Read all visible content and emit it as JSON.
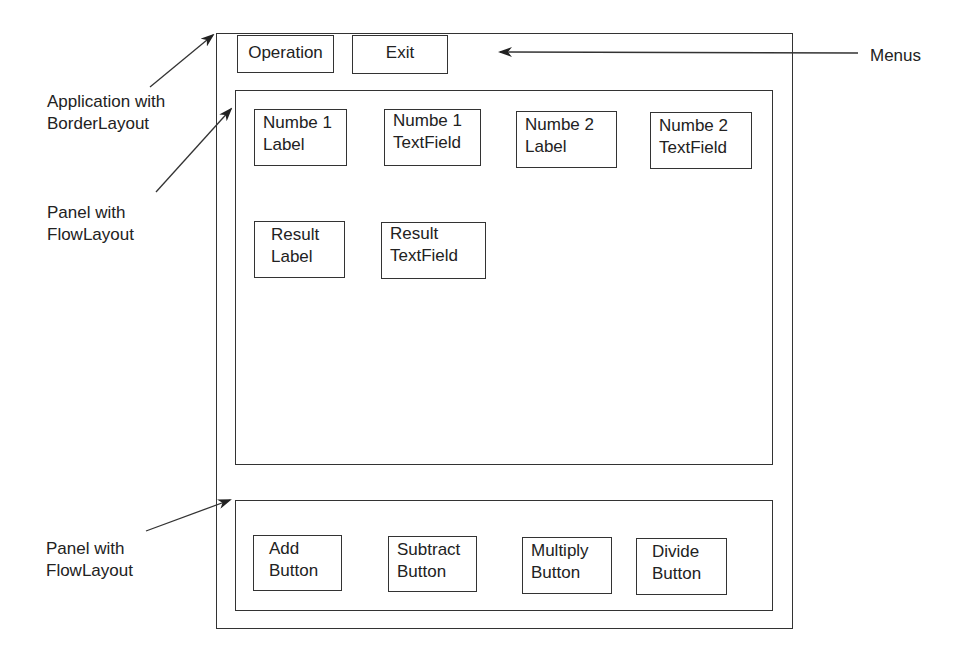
{
  "menus": {
    "items": [
      {
        "label": "Operation"
      },
      {
        "label": "Exit"
      }
    ]
  },
  "center_panel": {
    "components": [
      {
        "line1": "Numbe 1",
        "line2": "Label"
      },
      {
        "line1": "Numbe 1",
        "line2": "TextField"
      },
      {
        "line1": "Numbe 2",
        "line2": "Label"
      },
      {
        "line1": "Numbe 2",
        "line2": "TextField"
      },
      {
        "line1": "Result",
        "line2": "Label"
      },
      {
        "line1": "Result",
        "line2": "TextField"
      }
    ]
  },
  "south_panel": {
    "buttons": [
      {
        "line1": "Add",
        "line2": "Button"
      },
      {
        "line1": "Subtract",
        "line2": "Button"
      },
      {
        "line1": "Multiply",
        "line2": "Button"
      },
      {
        "line1": "Divide",
        "line2": "Button"
      }
    ]
  },
  "annotations": {
    "menus": "Menus",
    "application": {
      "line1": "Application with",
      "line2": "BorderLayout"
    },
    "center_panel": {
      "line1": "Panel with",
      "line2": "FlowLayout"
    },
    "south_panel": {
      "line1": "Panel with",
      "line2": "FlowLayout"
    }
  }
}
